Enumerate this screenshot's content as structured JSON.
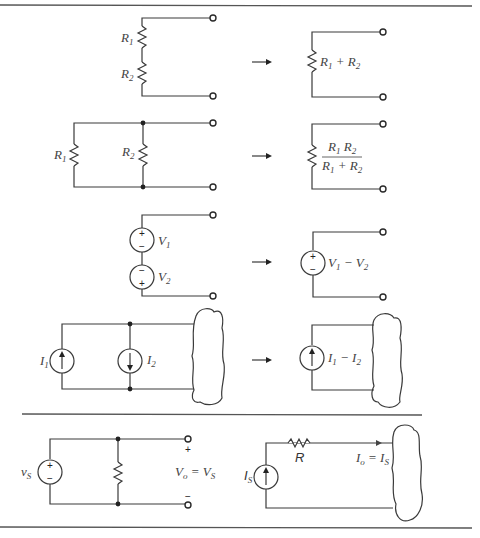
{
  "figure": {
    "sections": [
      {
        "id": "series-resistors",
        "left": {
          "labels": [
            "R",
            "R"
          ],
          "subs": [
            "1",
            "2"
          ]
        },
        "right": {
          "label": "R₁ + R₂",
          "parts": [
            "R",
            "1",
            " + R",
            "2"
          ]
        }
      },
      {
        "id": "parallel-resistors",
        "left": {
          "labels": [
            "R",
            "R"
          ],
          "subs": [
            "1",
            "2"
          ]
        },
        "right": {
          "numerator": [
            "R",
            "1",
            " R",
            "2"
          ],
          "denominator": [
            "R",
            "1",
            " + R",
            "2"
          ]
        }
      },
      {
        "id": "series-voltage-sources",
        "left": {
          "labels": [
            "V",
            "V"
          ],
          "subs": [
            "1",
            "2"
          ],
          "signs": [
            "+",
            "−",
            "−",
            "+"
          ]
        },
        "right": {
          "parts": [
            "V",
            "1",
            " − V",
            "2"
          ],
          "signs": [
            "+",
            "−"
          ]
        }
      },
      {
        "id": "parallel-current-sources",
        "left": {
          "labels": [
            "I",
            "I"
          ],
          "subs": [
            "1",
            "2"
          ]
        },
        "right": {
          "parts": [
            "I",
            "1",
            " − I",
            "2"
          ]
        }
      },
      {
        "id": "source-with-parallel-and-series-elements",
        "left": {
          "source_label": "v",
          "source_sub": "S",
          "signs": [
            "+",
            "−"
          ],
          "terminal_plus": "+",
          "terminal_minus": "−",
          "output": [
            "V",
            "o",
            " = V",
            "S"
          ]
        },
        "right": {
          "source_label": "I",
          "source_sub": "S",
          "resistor_label": "R",
          "output": [
            "I",
            "o",
            " = I",
            "S"
          ]
        }
      }
    ],
    "arrow": "→"
  }
}
